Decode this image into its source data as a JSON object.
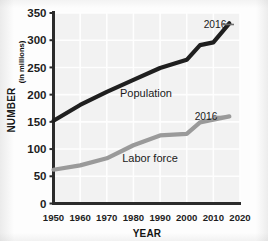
{
  "chart_data": {
    "type": "line",
    "title": "",
    "xlabel": "YEAR",
    "ylabel": "NUMBER (in millions)",
    "ylabel_main": "NUMBER",
    "ylabel_unit": "(in millions)",
    "xlim": [
      1950,
      2020
    ],
    "ylim": [
      0,
      350
    ],
    "yticks": [
      0,
      50,
      100,
      150,
      200,
      250,
      300,
      350
    ],
    "ytick_labels": [
      "0",
      "50",
      "100",
      "150",
      "200",
      "250",
      "300",
      "350"
    ],
    "xticks": [
      1950,
      1960,
      1970,
      1980,
      1990,
      2000,
      2010,
      2020
    ],
    "xtick_labels": [
      "1950",
      "1960",
      "1970",
      "1980",
      "1990",
      "2000",
      "2010",
      "2020"
    ],
    "grid": true,
    "legend": "inline-labels",
    "series": [
      {
        "name": "Population",
        "color": "#1f1f1f",
        "label": "Population",
        "x": [
          1950,
          1960,
          1970,
          1980,
          1990,
          2000,
          2005,
          2010,
          2016
        ],
        "values": [
          152,
          181,
          205,
          227,
          249,
          264,
          291,
          296,
          331
        ]
      },
      {
        "name": "Labor force",
        "color": "#9a9a9a",
        "label": "Labor force",
        "x": [
          1950,
          1960,
          1970,
          1980,
          1990,
          2000,
          2005,
          2010,
          2016
        ],
        "values": [
          62,
          70,
          83,
          107,
          125,
          128,
          149,
          154,
          160
        ]
      }
    ],
    "annotations": [
      {
        "text": "2016",
        "series": "Population",
        "year": 2016,
        "value": 331
      },
      {
        "text": "2016",
        "series": "Labor force",
        "year": 2016,
        "value": 160
      }
    ]
  },
  "colors": {
    "population_line": "#1f1f1f",
    "labor_line": "#9a9a9a",
    "axis": "#2b2b2b",
    "plot_background": "#f2f2f2",
    "gridline": "#ffffff",
    "text": "#1a1a1a"
  }
}
